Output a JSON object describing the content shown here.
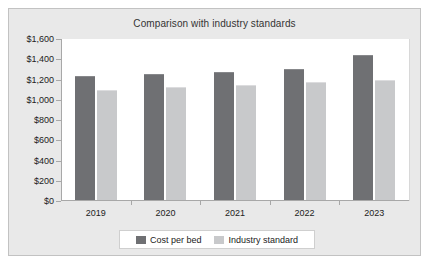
{
  "chart_data": {
    "type": "bar",
    "title": "Comparison with industry standards",
    "xlabel": "",
    "ylabel": "",
    "categories": [
      "2019",
      "2020",
      "2021",
      "2022",
      "2023"
    ],
    "series": [
      {
        "name": "Cost per bed",
        "color": "#6f7073",
        "values": [
          1225,
          1245,
          1265,
          1295,
          1430
        ]
      },
      {
        "name": "Industry standard",
        "color": "#c8c9cb",
        "values": [
          1090,
          1120,
          1140,
          1165,
          1185
        ]
      }
    ],
    "ylim": [
      0,
      1600
    ],
    "ytick_values": [
      0,
      200,
      400,
      600,
      800,
      1000,
      1200,
      1400,
      1600
    ],
    "ytick_labels": [
      "$0",
      "$200",
      "$400",
      "$600",
      "$800",
      "$1,000",
      "$1,200",
      "$1,400",
      "$1,600"
    ],
    "grid": false,
    "legend_position": "bottom"
  },
  "legend": {
    "entries": [
      {
        "label": "Cost per bed"
      },
      {
        "label": "Industry standard"
      }
    ]
  }
}
